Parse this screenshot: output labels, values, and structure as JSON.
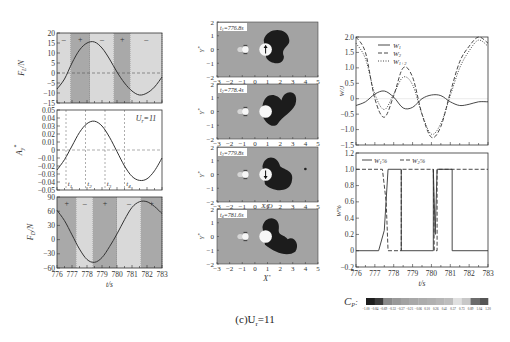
{
  "figure": {
    "caption": "(c)U",
    "caption_sub": "r",
    "caption_suffix": "=11"
  },
  "chart_data": [
    {
      "id": "lift-force",
      "type": "line",
      "title": "",
      "xlabel": "t/s",
      "ylabel": "F_L/N",
      "xlim": [
        776,
        783
      ],
      "ylim": [
        -15,
        20
      ],
      "yticks": [
        20,
        15,
        10,
        5,
        0,
        -5,
        -10,
        -15
      ],
      "x": [
        776,
        776.5,
        777,
        777.5,
        778,
        778.5,
        779,
        779.5,
        780,
        780.5,
        781,
        781.5,
        782,
        782.5,
        783
      ],
      "series": [
        {
          "name": "F_L",
          "values": [
            -8,
            -3,
            5,
            11.5,
            15,
            15.5,
            12.5,
            7,
            0.5,
            -5,
            -9,
            -11,
            -10,
            -7,
            -2
          ]
        }
      ],
      "regions": [
        {
          "from": 776,
          "to": 776.9,
          "sign": "-",
          "shade": "light"
        },
        {
          "from": 776.9,
          "to": 778.2,
          "sign": "+",
          "shade": "dark"
        },
        {
          "from": 778.2,
          "to": 779.8,
          "sign": "-",
          "shade": "light"
        },
        {
          "from": 779.8,
          "to": 780.9,
          "sign": "+",
          "shade": "dark"
        },
        {
          "from": 780.9,
          "to": 783,
          "sign": "-",
          "shade": "light"
        }
      ],
      "zero_line": "dashed"
    },
    {
      "id": "displacement",
      "type": "line",
      "xlabel": "t/s",
      "ylabel": "A_y*",
      "xlim": [
        776,
        783
      ],
      "ylim": [
        -0.05,
        0.05
      ],
      "yticks": [
        0.05,
        0.04,
        0.03,
        0.02,
        0.01,
        0,
        -0.01,
        -0.02,
        -0.03,
        -0.04,
        -0.05
      ],
      "x": [
        776,
        776.5,
        777,
        777.5,
        778,
        778.5,
        779,
        779.5,
        780,
        780.5,
        781,
        781.5,
        782,
        782.5,
        783
      ],
      "series": [
        {
          "name": "A_y*",
          "values": [
            -0.025,
            -0.012,
            0.005,
            0.022,
            0.033,
            0.036,
            0.03,
            0.016,
            -0.002,
            -0.02,
            -0.033,
            -0.038,
            -0.036,
            -0.026,
            -0.01
          ]
        }
      ],
      "annotation": "U_r=11",
      "markers": [
        {
          "t": 776.6,
          "label": "t1"
        },
        {
          "t": 777.9,
          "label": "t2"
        },
        {
          "t": 779.2,
          "label": "t3"
        },
        {
          "t": 780.5,
          "label": "t4"
        }
      ],
      "zero_line": "dashed"
    },
    {
      "id": "drag-force",
      "type": "line",
      "xlabel": "t/s",
      "ylabel": "F_D/N",
      "xlim": [
        776,
        783
      ],
      "ylim": [
        -60,
        90
      ],
      "xticks": [
        776,
        777,
        778,
        779,
        780,
        781,
        782,
        783
      ],
      "yticks": [
        90,
        60,
        30,
        0,
        -30,
        -60
      ],
      "x": [
        776,
        776.5,
        777,
        777.5,
        778,
        778.5,
        779,
        779.5,
        780,
        780.5,
        781,
        781.5,
        782,
        782.5,
        783
      ],
      "series": [
        {
          "name": "F_D",
          "values": [
            62,
            40,
            10,
            -20,
            -42,
            -48,
            -38,
            -15,
            12,
            42,
            68,
            80,
            80,
            70,
            55
          ]
        }
      ],
      "regions": [
        {
          "from": 776,
          "to": 777.3,
          "sign": "+",
          "shade": "dark"
        },
        {
          "from": 777.3,
          "to": 778.4,
          "sign": "-",
          "shade": "light"
        },
        {
          "from": 778.4,
          "to": 780,
          "sign": "+",
          "shade": "dark"
        },
        {
          "from": 780,
          "to": 781.6,
          "sign": "-",
          "shade": "light"
        },
        {
          "from": 781.6,
          "to": 783,
          "sign": "+",
          "shade": "dark"
        }
      ]
    },
    {
      "id": "energy-transfer",
      "type": "line",
      "xlabel": "t/s",
      "ylabel": "W/J",
      "xlim": [
        776,
        783
      ],
      "ylim": [
        -1.5,
        2.0
      ],
      "yticks": [
        2.0,
        1.5,
        1.0,
        0.5,
        0,
        -0.5,
        -1.0,
        -1.5
      ],
      "x": [
        776,
        776.5,
        777,
        777.5,
        778,
        778.5,
        779,
        779.5,
        780,
        780.5,
        781,
        781.5,
        782,
        782.5,
        783
      ],
      "legend": [
        "W1",
        "W2",
        "W1+2"
      ],
      "series": [
        {
          "name": "W1",
          "style": "solid",
          "values": [
            -0.22,
            -0.1,
            0.15,
            0.25,
            0.05,
            -0.3,
            -0.28,
            0.0,
            0.12,
            0.1,
            -0.1,
            -0.22,
            -0.18,
            -0.1,
            -0.1
          ]
        },
        {
          "name": "W2",
          "style": "dashed",
          "values": [
            2.0,
            1.5,
            0.0,
            -0.6,
            0.1,
            1.0,
            0.7,
            -0.5,
            -1.25,
            -0.9,
            0.2,
            1.2,
            1.7,
            2.0,
            1.8
          ]
        },
        {
          "name": "W1+2",
          "style": "dotted",
          "values": [
            1.8,
            1.3,
            0.15,
            -0.35,
            0.15,
            0.7,
            0.45,
            -0.5,
            -1.15,
            -0.8,
            0.1,
            1.0,
            1.55,
            1.9,
            1.7
          ]
        }
      ],
      "legend_position": "upper-left"
    },
    {
      "id": "energy-percentage",
      "type": "line",
      "xlabel": "t/s",
      "ylabel": "W%",
      "xlim": [
        776,
        783
      ],
      "ylim": [
        -0.2,
        1.2
      ],
      "xticks": [
        776,
        777,
        778,
        779,
        780,
        781,
        782,
        783
      ],
      "yticks": [
        1.2,
        1.0,
        0.8,
        0.6,
        0.4,
        0.2,
        0,
        -0.2
      ],
      "legend": [
        "W1%",
        "W2%"
      ],
      "series": [
        {
          "name": "W1%",
          "style": "solid",
          "points": [
            [
              776,
              0
            ],
            [
              777.2,
              0
            ],
            [
              777.5,
              0.25
            ],
            [
              777.7,
              1.0
            ],
            [
              778.4,
              1.0
            ],
            [
              778.4,
              0
            ],
            [
              780.1,
              0
            ],
            [
              780.1,
              1.0
            ],
            [
              780.2,
              0.2
            ],
            [
              780.3,
              1.0
            ],
            [
              781.1,
              1.0
            ],
            [
              781.1,
              0
            ],
            [
              783,
              0
            ]
          ]
        },
        {
          "name": "W2%",
          "style": "dashed",
          "points": [
            [
              776,
              1.0
            ],
            [
              777.4,
              1.0
            ],
            [
              777.6,
              0.6
            ],
            [
              777.7,
              0
            ],
            [
              778.4,
              0
            ],
            [
              778.4,
              1.0
            ],
            [
              780.1,
              1.0
            ],
            [
              780.15,
              0
            ],
            [
              780.3,
              0
            ],
            [
              780.3,
              1.0
            ],
            [
              783,
              1.0
            ]
          ]
        }
      ],
      "legend_position": "upper-left"
    }
  ],
  "flow_panels": {
    "xlabel": "X*",
    "mid_xlabel": "X/D",
    "ylabel": "Y*",
    "xticks": [
      "-3",
      "-2",
      "-1",
      "0",
      "1",
      "2",
      "3",
      "4",
      "5"
    ],
    "yticks": [
      "2",
      "1",
      "0",
      "-1",
      "-2"
    ],
    "frames": [
      {
        "label": "t1=776.8s",
        "arrow": "up"
      },
      {
        "label": "t2=778.4s",
        "arrow": "none"
      },
      {
        "label": "t3=779.8s",
        "arrow": "down"
      },
      {
        "label": "t4=781.6s",
        "arrow": "none"
      }
    ]
  },
  "colorbar": {
    "label": "C",
    "label_sub": "P",
    "label_suffix": ":",
    "ticks": [
      "-1.00",
      "-0.84",
      "-0.69",
      "-0.53",
      "-0.37",
      "-0.21",
      "-0.06",
      "0.10",
      "0.26",
      "0.41",
      "0.57",
      "0.73",
      "0.89",
      "1.04",
      "1.20"
    ],
    "colors": [
      "#1e1e1e",
      "#3a3a3a",
      "#8a8a8a",
      "#999999",
      "#a2a2a2",
      "#a8a8a8",
      "#acacac",
      "#b0b0b0",
      "#b6b6b6",
      "#bdbdbd",
      "#e0e0e0",
      "#c8c8c8",
      "#6c6c6c",
      "#555555"
    ]
  }
}
